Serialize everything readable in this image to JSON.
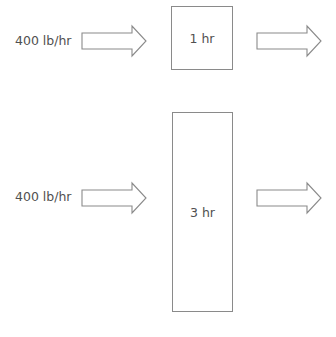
{
  "diagram": {
    "type": "flow",
    "rows": [
      {
        "input_label": "400 lb/hr",
        "vessel_label": "1 hr"
      },
      {
        "input_label": "400 lb/hr",
        "vessel_label": "3 hr"
      }
    ],
    "colors": {
      "stroke": "#8a8a8a",
      "text": "#505050",
      "background": "#ffffff"
    }
  }
}
